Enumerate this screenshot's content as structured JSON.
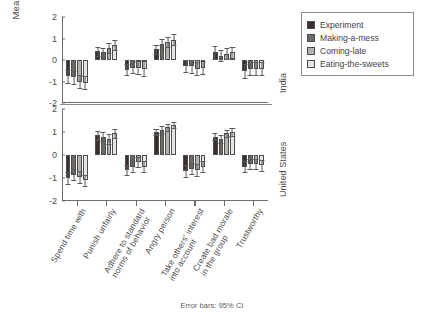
{
  "caption": "Error bars: 95% CI",
  "axis": {
    "ylabel": "Mean response",
    "yticks": [
      "2",
      "1",
      "0",
      "-1",
      "-2"
    ]
  },
  "panels": [
    {
      "key": "india",
      "label": "India"
    },
    {
      "key": "us",
      "label": "United States"
    }
  ],
  "legend": {
    "items": [
      {
        "label": "Experiment",
        "color": "#3b2f2c"
      },
      {
        "label": "Making-a-mess",
        "color": "#6e6a66"
      },
      {
        "label": "Coming-late",
        "color": "#b5b2ae"
      },
      {
        "label": "Eating-the-sweets",
        "color": "#e7e5e1"
      }
    ]
  },
  "chart_data": {
    "type": "bar",
    "title": "",
    "subtitle": "",
    "xlabel": "",
    "ylabel": "Mean response",
    "ylim": [
      -2,
      2
    ],
    "yticks": [
      2,
      1,
      0,
      -1,
      -2
    ],
    "grid": false,
    "legend_position": "top-right",
    "error_bars": "95% CI",
    "categories": [
      "Spend time with",
      "Punish unfairly",
      "Adhere to standard norms of behavior",
      "Angry person",
      "Take others' interest into account",
      "Create bad morale in the group",
      "Trustworthy"
    ],
    "category_lines": [
      [
        "Spend time with",
        ""
      ],
      [
        "Punish unfairly",
        ""
      ],
      [
        "Adhere to standard",
        "norms of behavior"
      ],
      [
        "Angry person",
        ""
      ],
      [
        "Take others' interest",
        "into account"
      ],
      [
        "Create bad morale",
        "in the group"
      ],
      [
        "Trustworthy",
        ""
      ]
    ],
    "panels": [
      {
        "name": "India",
        "series": [
          {
            "name": "Experiment",
            "values": [
              -0.75,
              0.4,
              -0.45,
              0.5,
              -0.3,
              0.35,
              -0.5
            ],
            "ci_low": [
              -1.05,
              0.2,
              -0.72,
              0.28,
              -0.58,
              0.06,
              -0.82
            ],
            "ci_high": [
              -0.45,
              0.6,
              -0.18,
              0.72,
              -0.02,
              0.64,
              -0.18
            ]
          },
          {
            "name": "Making-a-mess",
            "values": [
              -0.8,
              0.35,
              -0.35,
              0.75,
              -0.3,
              0.2,
              -0.4
            ],
            "ci_low": [
              -1.1,
              0.14,
              -0.62,
              0.52,
              -0.6,
              -0.06,
              -0.7
            ],
            "ci_high": [
              -0.5,
              0.56,
              -0.08,
              0.98,
              0.0,
              0.46,
              -0.1
            ]
          },
          {
            "name": "Coming-late",
            "values": [
              -1.0,
              0.55,
              -0.35,
              0.85,
              -0.4,
              0.3,
              -0.4
            ],
            "ci_low": [
              -1.32,
              0.32,
              -0.64,
              0.62,
              -0.7,
              0.04,
              -0.7
            ],
            "ci_high": [
              -0.68,
              0.78,
              -0.06,
              1.08,
              -0.1,
              0.56,
              -0.1
            ]
          },
          {
            "name": "Eating-the-sweets",
            "values": [
              -1.05,
              0.7,
              -0.4,
              0.95,
              -0.35,
              0.35,
              -0.4
            ],
            "ci_low": [
              -1.34,
              0.46,
              -0.76,
              0.7,
              -0.66,
              0.08,
              -0.72
            ],
            "ci_high": [
              -0.76,
              0.94,
              -0.04,
              1.2,
              -0.04,
              0.62,
              -0.08
            ]
          }
        ]
      },
      {
        "name": "United States",
        "series": [
          {
            "name": "Experiment",
            "values": [
              -1.0,
              0.85,
              -0.65,
              1.0,
              -0.7,
              0.8,
              -0.5
            ],
            "ci_low": [
              -1.24,
              0.66,
              -0.86,
              0.86,
              -0.96,
              0.64,
              -0.74
            ],
            "ci_high": [
              -0.76,
              1.04,
              -0.44,
              1.14,
              -0.44,
              0.96,
              -0.26
            ]
          },
          {
            "name": "Making-a-mess",
            "values": [
              -0.85,
              0.8,
              -0.5,
              1.1,
              -0.6,
              0.7,
              -0.4
            ],
            "ci_low": [
              -1.1,
              0.62,
              -0.72,
              0.96,
              -0.84,
              0.54,
              -0.62
            ],
            "ci_high": [
              -0.6,
              0.98,
              -0.28,
              1.24,
              -0.36,
              0.86,
              -0.18
            ]
          },
          {
            "name": "Coming-late",
            "values": [
              -0.95,
              0.7,
              -0.3,
              1.2,
              -0.65,
              0.95,
              -0.4
            ],
            "ci_low": [
              -1.2,
              0.5,
              -0.52,
              1.06,
              -0.9,
              0.8,
              -0.62
            ],
            "ci_high": [
              -0.7,
              0.9,
              -0.08,
              1.34,
              -0.4,
              1.1,
              -0.18
            ]
          },
          {
            "name": "Eating-the-sweets",
            "values": [
              -1.1,
              0.95,
              -0.5,
              1.3,
              -0.5,
              1.0,
              -0.45
            ],
            "ci_low": [
              -1.34,
              0.76,
              -0.74,
              1.16,
              -0.74,
              0.84,
              -0.68
            ],
            "ci_high": [
              -0.86,
              1.14,
              -0.26,
              1.44,
              -0.26,
              1.16,
              -0.22
            ]
          }
        ]
      }
    ]
  }
}
